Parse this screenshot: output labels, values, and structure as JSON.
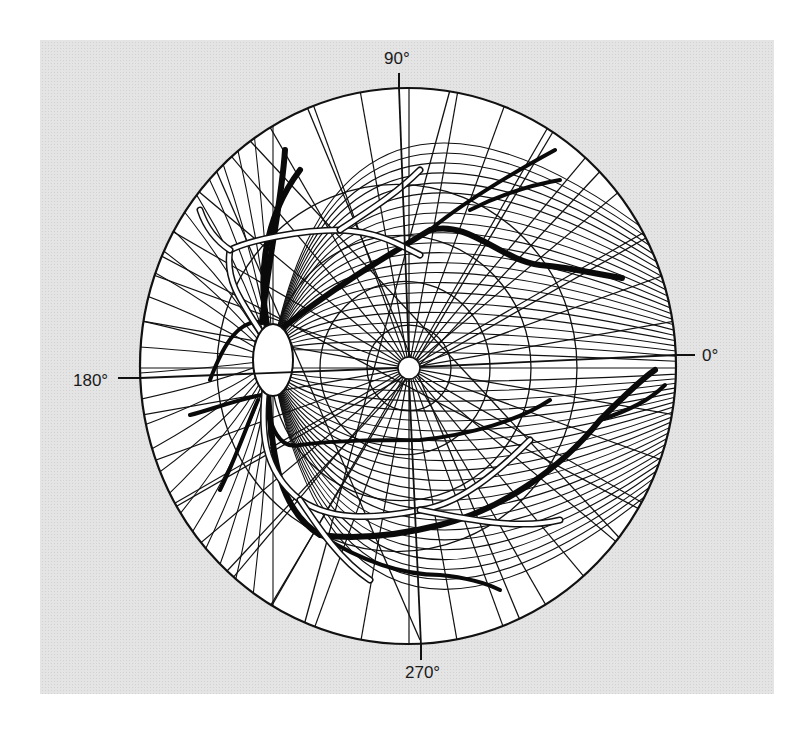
{
  "figure": {
    "colors": {
      "background": "#ffffff",
      "panel": "#e6e6e6",
      "fundus": "#ffffff",
      "ink": "#111111"
    },
    "axis_labels": {
      "top": "90°",
      "left": "180°",
      "right": "0°",
      "bottom": "270°"
    },
    "structures": [
      {
        "name": "optic-disc",
        "label": ""
      },
      {
        "name": "fovea",
        "label": ""
      },
      {
        "name": "retinal-vessels",
        "label": ""
      },
      {
        "name": "nerve-fiber-arcs",
        "label": ""
      },
      {
        "name": "polar-grid",
        "label": ""
      }
    ]
  }
}
